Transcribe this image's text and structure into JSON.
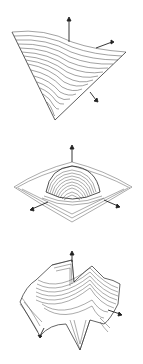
{
  "figure": {
    "panels": [
      {
        "id": "surface-1",
        "shape": "saddle-like sheet, tilted"
      },
      {
        "id": "surface-2",
        "shape": "dome with rippled square rim"
      },
      {
        "id": "surface-3",
        "shape": "oscillating wave surface"
      }
    ],
    "colors": {
      "line": "#333333",
      "background": "#ffffff"
    }
  }
}
